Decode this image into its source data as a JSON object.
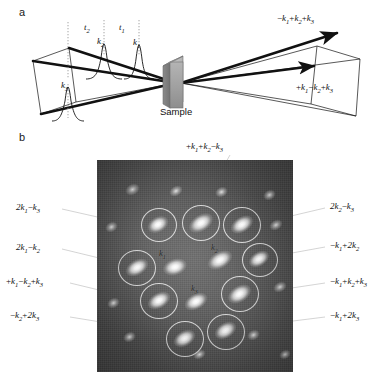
{
  "figure": {
    "panel_a_letter": "a",
    "panel_b_letter": "b"
  },
  "panel_a": {
    "sample_label": "Sample",
    "delay_labels": [
      {
        "name": "t2",
        "text": "t2",
        "base": "t",
        "sub": "2"
      },
      {
        "name": "t1",
        "text": "t1",
        "base": "t",
        "sub": "1"
      }
    ],
    "pulse_labels": [
      {
        "name": "k2",
        "base": "k",
        "sub": "2"
      },
      {
        "name": "k1",
        "base": "k",
        "sub": "1"
      },
      {
        "name": "k3",
        "base": "k",
        "sub": "3"
      }
    ],
    "output_labels": [
      {
        "name": "signal-upper",
        "parts": "−k1+k2+k3"
      },
      {
        "name": "signal-lower",
        "parts": "+k1−k2+k3"
      }
    ]
  },
  "panel_b": {
    "center_spots": [
      {
        "base": "k",
        "sub": "1"
      },
      {
        "base": "k",
        "sub": "2"
      },
      {
        "base": "k",
        "sub": "3"
      }
    ],
    "callouts": [
      {
        "id": "top",
        "text": "+k1+k2−k3"
      },
      {
        "id": "left-1",
        "text": "2k1−k3"
      },
      {
        "id": "left-2",
        "text": "2k1−k2"
      },
      {
        "id": "left-3",
        "text": "+k1−k2+k3"
      },
      {
        "id": "left-4",
        "text": "−k2+2k3"
      },
      {
        "id": "right-1",
        "text": "2k2−k3"
      },
      {
        "id": "right-2",
        "text": "−k1+2k2"
      },
      {
        "id": "right-3",
        "text": "−k1+k2+k3"
      },
      {
        "id": "right-4",
        "text": "−k1+2k3"
      }
    ]
  },
  "colors": {
    "ink": "#111111",
    "plate_base": "#4a4a4a",
    "sample_box": "#9a9a9a",
    "ring_stroke": "#ebebeb"
  }
}
